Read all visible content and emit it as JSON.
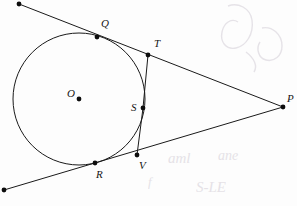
{
  "figure": {
    "canvas": {
      "width": 297,
      "height": 206
    },
    "background_color": "#fdfdfd",
    "stroke_color": "#1a1a1a",
    "label_color": "#151515",
    "watermark_color": "#ded9e0"
  },
  "circle": {
    "name": "circle-O",
    "center_label": "O",
    "cx": 79,
    "cy": 99,
    "r": 66
  },
  "points": [
    {
      "id": "O",
      "label": "O",
      "x": 79,
      "y": 99,
      "label_x": 67,
      "label_y": 97,
      "on_circle": false,
      "role": "center"
    },
    {
      "id": "Q",
      "label": "Q",
      "x": 97,
      "y": 37,
      "label_x": 101,
      "label_y": 27,
      "on_circle": true,
      "role": "tangent-point-upper"
    },
    {
      "id": "T",
      "label": "T",
      "x": 148,
      "y": 55,
      "label_x": 154,
      "label_y": 47,
      "on_circle": false,
      "role": "chord-endpoint-upper"
    },
    {
      "id": "S",
      "label": "S",
      "x": 143,
      "y": 108,
      "label_x": 131,
      "label_y": 111,
      "on_circle": true,
      "role": "chord-intersection"
    },
    {
      "id": "V",
      "label": "V",
      "x": 137,
      "y": 155,
      "label_x": 139,
      "label_y": 169,
      "on_circle": false,
      "role": "chord-endpoint-lower"
    },
    {
      "id": "R",
      "label": "R",
      "x": 95,
      "y": 163,
      "label_x": 96,
      "label_y": 178,
      "on_circle": true,
      "role": "tangent-point-lower"
    },
    {
      "id": "P",
      "label": "P",
      "x": 283,
      "y": 107,
      "label_x": 287,
      "label_y": 102,
      "on_circle": false,
      "role": "external-apex"
    }
  ],
  "endpoint_dots": [
    {
      "id": "upper-ray-end",
      "x": 19,
      "y": 4
    },
    {
      "id": "lower-ray-end",
      "x": 4,
      "y": 190
    }
  ],
  "lines": [
    {
      "id": "upper-tangent-line",
      "label": "upper tangent through Q and T to P",
      "x1": 19,
      "y1": 4,
      "x2": 283,
      "y2": 107
    },
    {
      "id": "lower-tangent-line",
      "label": "lower tangent through R and V to P",
      "x1": 4,
      "y1": 190,
      "x2": 283,
      "y2": 107
    },
    {
      "id": "chord-T-S",
      "label": "segment T to S",
      "x1": 148,
      "y1": 55,
      "x2": 143,
      "y2": 108
    },
    {
      "id": "chord-S-V",
      "label": "segment S to V",
      "x1": 143,
      "y1": 108,
      "x2": 137,
      "y2": 155
    }
  ],
  "dot_radius": 2.4,
  "watermark": {
    "visible": true,
    "description": "faint scanned paper smudges and handwriting ghosting"
  }
}
